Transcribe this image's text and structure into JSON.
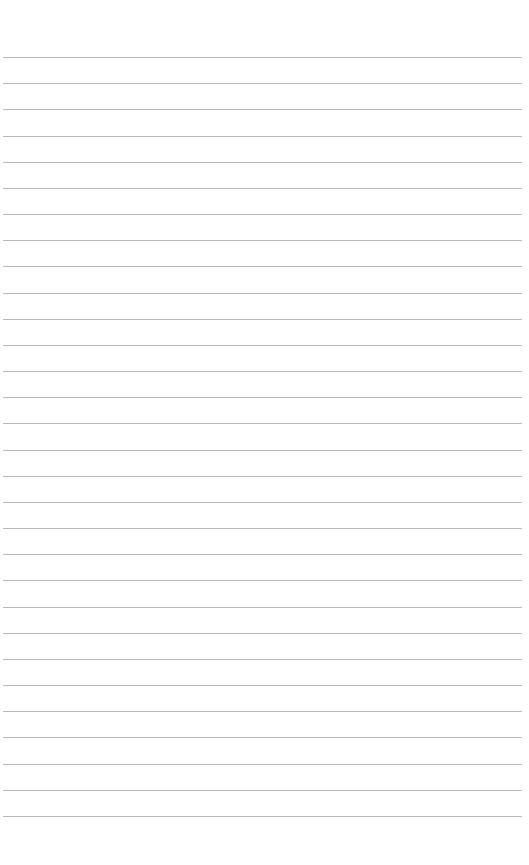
{
  "page": {
    "type": "lined-paper",
    "background_color": "#ffffff",
    "line_color": "#b8b8b8",
    "line_count": 30,
    "first_line_y": 57,
    "line_spacing": 26.17,
    "line_left": 3,
    "line_width": 519
  }
}
